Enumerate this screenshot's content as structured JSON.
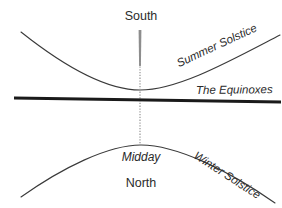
{
  "diagram": {
    "title_visible": false,
    "background_color": "#ffffff",
    "line_color": "#3a3a3a",
    "bold_line_color": "#1a1a1a",
    "meridian_color": "#9a9a9a",
    "labels": {
      "south": "South",
      "north": "North",
      "midday": "Midday",
      "equinoxes": "The Equinoxes",
      "summer_solstice": "Summer Solstice",
      "winter_solstice": "Winter Solstice"
    },
    "curves": {
      "summer_solstice": {
        "name": "summer-solstice-curve",
        "description": "upward-opening arc with minimum near center",
        "path": "M 21 32 C 60 63, 105 90, 140 90 C 178 90, 228 62, 280 35"
      },
      "winter_solstice": {
        "name": "winter-solstice-curve",
        "description": "downward-opening arc with maximum near center",
        "path": "M 21 197 C 62 168, 108 145, 141 145 C 176 145, 228 170, 275 203"
      },
      "equinoxes": {
        "name": "equinox-line",
        "description": "near-horizontal bold straight line",
        "path": "M 14 98 L 281 102"
      },
      "meridian": {
        "name": "meridian-line",
        "description": "vertical dotted line through center",
        "path": "M 140 30 L 140 146"
      }
    }
  }
}
